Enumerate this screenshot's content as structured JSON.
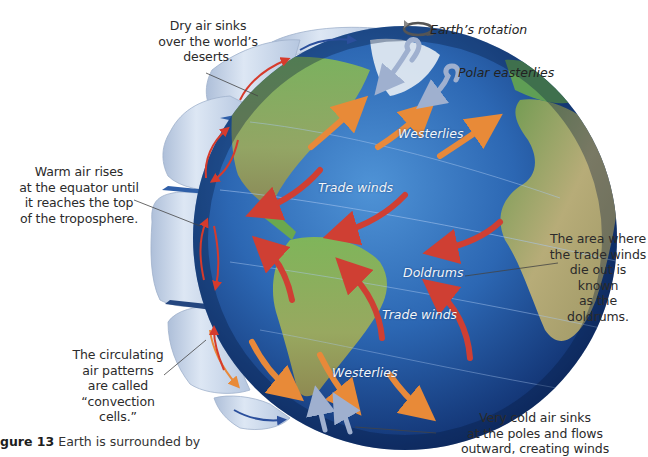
{
  "figure": {
    "caption_number": "gure 13",
    "caption_text": "Earth is surrounded by"
  },
  "top_labels": {
    "rotation": "Earth’s rotation",
    "polar_easterlies": "Polar easterlies"
  },
  "globe_labels": {
    "westerlies_north": "Westerlies",
    "trade_winds_north": "Trade winds",
    "doldrums": "Doldrums",
    "trade_winds_south": "Trade winds",
    "westerlies_south": "Westerlies"
  },
  "callouts": {
    "dry_air": "Dry air sinks\nover the world’s\ndeserts.",
    "warm_air": "Warm air rises\nat the equator until\nit reaches the top\nof the troposphere.",
    "doldrums_def": "The area where\nthe trade winds\ndie out is known\nas the doldrums.",
    "convection": "The circulating\nair patterns\nare called\n“convection cells.”",
    "cold_air": "Very cold air sinks\nat the poles and flows\noutward, creating winds"
  },
  "icons": {
    "rotation": "curved-rotation-arrow-icon",
    "polar_arrows": "hook-arrow-icon"
  },
  "colors": {
    "ocean_light": "#3d7fc4",
    "ocean_deep": "#0d2a5c",
    "land_green": "#6aa84f",
    "land_desert": "#b9b07a",
    "trade_wind_arrow": "#d0453a",
    "westerly_arrow": "#e8893a",
    "polar_arrow": "#a9b8d6",
    "cell_band": "#c9d7ea",
    "cell_arrow_red": "#d63b2c",
    "cell_arrow_blue": "#2b4f9c"
  }
}
